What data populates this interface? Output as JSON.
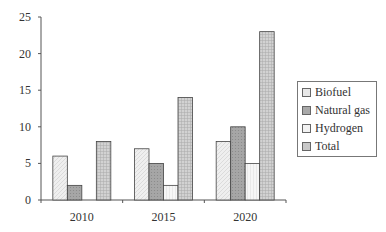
{
  "chart_data": {
    "type": "bar",
    "title": "",
    "xlabel": "",
    "ylabel": "",
    "categories": [
      "2010",
      "2015",
      "2020"
    ],
    "series": [
      {
        "name": "Biofuel",
        "values": [
          6,
          7,
          8
        ],
        "color": "#e8e8e8"
      },
      {
        "name": "Natural gas",
        "values": [
          2,
          5,
          10
        ],
        "color": "#a9a9a9"
      },
      {
        "name": "Hydrogen",
        "values": [
          0,
          2,
          5
        ],
        "color": "#f2f2f2"
      },
      {
        "name": "Total",
        "values": [
          8,
          14,
          23
        ],
        "color": "#c8c8c8"
      }
    ],
    "ylim": [
      0,
      25
    ],
    "yticks": [
      0,
      5,
      10,
      15,
      20,
      25
    ],
    "grid": false,
    "legend_position": "right"
  }
}
